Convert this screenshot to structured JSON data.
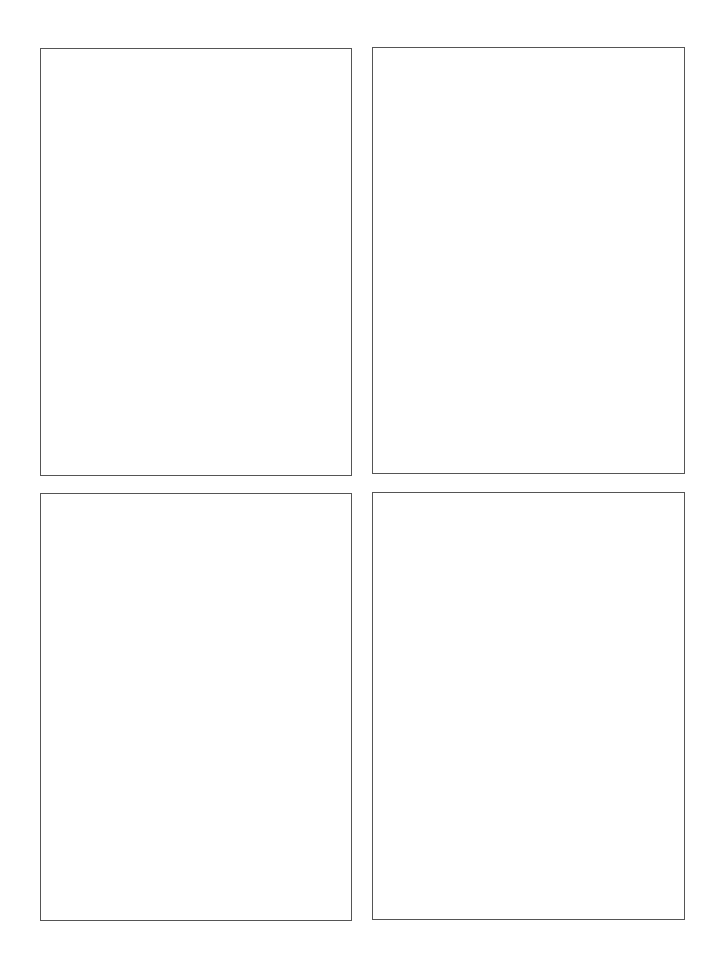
{
  "page": {
    "background": "#ffffff",
    "border_color": "#555555"
  },
  "panels": [
    {
      "position": "top-left",
      "content": ""
    },
    {
      "position": "top-right",
      "content": ""
    },
    {
      "position": "bottom-left",
      "content": ""
    },
    {
      "position": "bottom-right",
      "content": ""
    }
  ]
}
